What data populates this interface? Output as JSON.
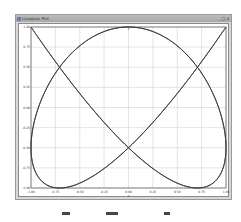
{
  "window": {
    "title": "Lissajous Plot",
    "minimize_glyph": "_",
    "maximize_glyph": "□",
    "close_glyph": "×"
  },
  "plot": {
    "top_axis_label": "Y",
    "x_axis_title": "X",
    "y_axis_title": "Y",
    "line_color": "#3a3a3a",
    "grid_color": "#d4d4d4"
  },
  "chart_data": {
    "type": "line",
    "xlabel": "X",
    "ylabel": "Y",
    "xlim": [
      -1.0,
      1.0
    ],
    "ylim": [
      -1.0,
      1.0
    ],
    "grid": true,
    "x_ticks": [
      "-1.00",
      "-0.75",
      "-0.50",
      "-0.25",
      "0.00",
      "0.25",
      "0.50",
      "0.75",
      "1.00"
    ],
    "y_ticks": [
      "1.00",
      "0.75",
      "0.50",
      "0.25",
      "0.00",
      "-0.25",
      "-0.50",
      "-0.75",
      "-1.00"
    ],
    "series": [
      {
        "name": "lissajous",
        "parametric": "x = sin(3t), y = cos(4t)",
        "t_range": [
          0,
          6.2832
        ]
      }
    ]
  },
  "toolbar": {
    "items": [
      "zoom-icon",
      "pan-icon",
      "reset-icon"
    ]
  }
}
